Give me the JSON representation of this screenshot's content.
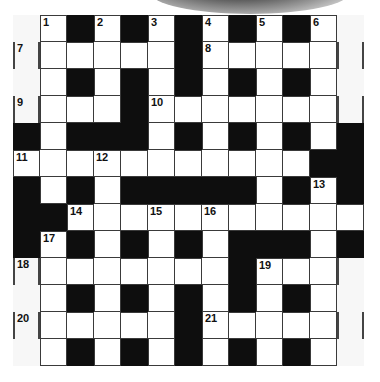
{
  "puzzle": {
    "type": "crossword",
    "rows": 13,
    "cols": 13,
    "legend": {
      "W": "white-cell",
      "B": "black-cell",
      "F": "outer-margin-cell"
    },
    "grid": [
      [
        "F",
        "W",
        "B",
        "W",
        "B",
        "W",
        "B",
        "W",
        "B",
        "W",
        "B",
        "W",
        "F"
      ],
      [
        "F",
        "W",
        "W",
        "W",
        "W",
        "W",
        "B",
        "W",
        "W",
        "W",
        "W",
        "W",
        "F"
      ],
      [
        "F",
        "W",
        "B",
        "W",
        "B",
        "W",
        "B",
        "W",
        "B",
        "W",
        "B",
        "W",
        "F"
      ],
      [
        "F",
        "W",
        "W",
        "W",
        "B",
        "W",
        "W",
        "W",
        "W",
        "W",
        "W",
        "W",
        "F"
      ],
      [
        "B",
        "W",
        "B",
        "B",
        "B",
        "W",
        "B",
        "W",
        "B",
        "W",
        "B",
        "W",
        "B"
      ],
      [
        "W",
        "W",
        "W",
        "W",
        "W",
        "W",
        "W",
        "W",
        "W",
        "W",
        "W",
        "B",
        "B"
      ],
      [
        "B",
        "W",
        "B",
        "W",
        "B",
        "B",
        "B",
        "B",
        "B",
        "W",
        "B",
        "W",
        "B"
      ],
      [
        "B",
        "B",
        "W",
        "W",
        "W",
        "W",
        "W",
        "W",
        "W",
        "W",
        "W",
        "W",
        "W"
      ],
      [
        "B",
        "W",
        "B",
        "W",
        "B",
        "W",
        "B",
        "W",
        "B",
        "B",
        "B",
        "W",
        "B"
      ],
      [
        "F",
        "W",
        "W",
        "W",
        "W",
        "W",
        "W",
        "W",
        "B",
        "W",
        "W",
        "W",
        "F"
      ],
      [
        "F",
        "W",
        "B",
        "W",
        "B",
        "W",
        "B",
        "W",
        "B",
        "W",
        "B",
        "W",
        "F"
      ],
      [
        "F",
        "W",
        "W",
        "W",
        "W",
        "W",
        "B",
        "W",
        "W",
        "W",
        "W",
        "W",
        "F"
      ],
      [
        "F",
        "W",
        "B",
        "W",
        "B",
        "W",
        "B",
        "W",
        "B",
        "W",
        "B",
        "W",
        "F"
      ]
    ],
    "numbers": [
      {
        "n": "1",
        "r": 0,
        "c": 1
      },
      {
        "n": "2",
        "r": 0,
        "c": 3
      },
      {
        "n": "3",
        "r": 0,
        "c": 5
      },
      {
        "n": "4",
        "r": 0,
        "c": 7
      },
      {
        "n": "5",
        "r": 0,
        "c": 9
      },
      {
        "n": "6",
        "r": 0,
        "c": 11
      },
      {
        "n": "7",
        "r": 1,
        "c": 0
      },
      {
        "n": "8",
        "r": 1,
        "c": 7
      },
      {
        "n": "9",
        "r": 3,
        "c": 0
      },
      {
        "n": "10",
        "r": 3,
        "c": 5
      },
      {
        "n": "11",
        "r": 5,
        "c": 0
      },
      {
        "n": "12",
        "r": 5,
        "c": 3
      },
      {
        "n": "13",
        "r": 6,
        "c": 11
      },
      {
        "n": "14",
        "r": 7,
        "c": 2
      },
      {
        "n": "15",
        "r": 7,
        "c": 5
      },
      {
        "n": "16",
        "r": 7,
        "c": 7
      },
      {
        "n": "17",
        "r": 8,
        "c": 1
      },
      {
        "n": "18",
        "r": 9,
        "c": 0
      },
      {
        "n": "19",
        "r": 9,
        "c": 9
      },
      {
        "n": "20",
        "r": 11,
        "c": 0
      },
      {
        "n": "21",
        "r": 11,
        "c": 7
      }
    ],
    "margin_bars": [
      {
        "r": 1,
        "c": 0,
        "sides": [
          "L",
          "R"
        ]
      },
      {
        "r": 3,
        "c": 0,
        "sides": [
          "L",
          "R"
        ]
      },
      {
        "r": 9,
        "c": 0,
        "sides": [
          "L",
          "R"
        ]
      },
      {
        "r": 11,
        "c": 0,
        "sides": [
          "L",
          "R"
        ]
      },
      {
        "r": 1,
        "c": 12,
        "sides": [
          "L",
          "R"
        ]
      },
      {
        "r": 3,
        "c": 12,
        "sides": [
          "L",
          "R"
        ]
      },
      {
        "r": 9,
        "c": 12,
        "sides": [
          "L"
        ]
      },
      {
        "r": 11,
        "c": 12,
        "sides": [
          "L",
          "R"
        ]
      }
    ]
  },
  "colors": {
    "black_cell": "#0e0e0e",
    "white_cell": "#ffffff",
    "margin_cell": "#f7f7f7",
    "grid_line": "#3a3a3a"
  }
}
